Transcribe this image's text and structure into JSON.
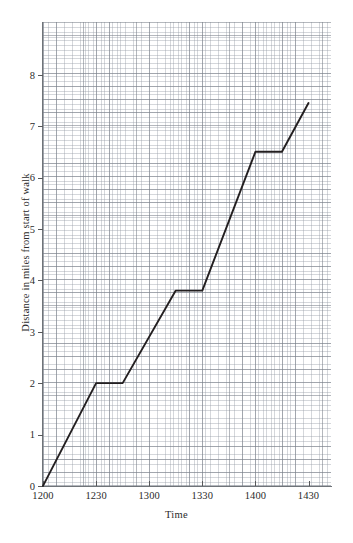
{
  "chart_data": {
    "type": "line",
    "title": "",
    "xlabel": "Time",
    "ylabel": "Distance in miles from start of walk",
    "xlim": [
      1200,
      1435
    ],
    "ylim": [
      0,
      8.75
    ],
    "grid": true,
    "grid_style": "graph paper, minor squares with darker major lines every 5 squares",
    "legend": "none",
    "x_tick_labels": [
      "1200",
      "1230",
      "1300",
      "1330",
      "1400",
      "1430"
    ],
    "x_tick_values": [
      1200,
      1230,
      1300,
      1330,
      1400,
      1430
    ],
    "y_tick_labels": [
      "0",
      "1",
      "2",
      "3",
      "4",
      "5",
      "6",
      "7",
      "8"
    ],
    "y_tick_values": [
      0,
      1,
      2,
      3,
      4,
      5,
      6,
      7,
      8
    ],
    "series": [
      {
        "name": "Distance walked",
        "color": "#231f20",
        "x": [
          1200,
          1230,
          1245,
          1315,
          1330,
          1400,
          1415,
          1430
        ],
        "y": [
          0,
          2,
          2,
          3.8,
          3.8,
          6.5,
          6.5,
          7.45
        ],
        "x_labels": [
          "1200",
          "1230",
          "1245",
          "1315",
          "1330",
          "1400",
          "1415",
          "1430"
        ]
      }
    ],
    "segments": [
      {
        "from_time": "1200",
        "to_time": "1230",
        "from_distance": 0,
        "to_distance": 2,
        "type": "walking"
      },
      {
        "from_time": "1230",
        "to_time": "1245",
        "from_distance": 2,
        "to_distance": 2,
        "type": "rest"
      },
      {
        "from_time": "1245",
        "to_time": "1315",
        "from_distance": 2,
        "to_distance": 3.8,
        "type": "walking"
      },
      {
        "from_time": "1315",
        "to_time": "1330",
        "from_distance": 3.8,
        "to_distance": 3.8,
        "type": "rest"
      },
      {
        "from_time": "1330",
        "to_time": "1400",
        "from_distance": 3.8,
        "to_distance": 6.5,
        "type": "walking"
      },
      {
        "from_time": "1400",
        "to_time": "1415",
        "from_distance": 6.5,
        "to_distance": 6.5,
        "type": "rest"
      },
      {
        "from_time": "1415",
        "to_time": "1430",
        "from_distance": 6.5,
        "to_distance": 7.45,
        "type": "walking"
      }
    ]
  },
  "axes": {
    "x_ticks": [
      {
        "label": "1200",
        "value": 1200
      },
      {
        "label": "1230",
        "value": 1230
      },
      {
        "label": "1300",
        "value": 1300
      },
      {
        "label": "1330",
        "value": 1330
      },
      {
        "label": "1400",
        "value": 1400
      },
      {
        "label": "1430",
        "value": 1430
      }
    ],
    "y_ticks": [
      {
        "label": "8",
        "value": 8
      },
      {
        "label": "7",
        "value": 7
      },
      {
        "label": "6",
        "value": 6
      },
      {
        "label": "5",
        "value": 5
      },
      {
        "label": "4",
        "value": 4
      },
      {
        "label": "3",
        "value": 3
      },
      {
        "label": "2",
        "value": 2
      },
      {
        "label": "1",
        "value": 1
      },
      {
        "label": "0",
        "value": 0
      }
    ],
    "x_title": "Time",
    "y_title": "Distance in miles from start of walk"
  },
  "colors": {
    "line": "#231f20",
    "axis": "#6f7479",
    "grid_major": "#787e88",
    "grid_minor": "#969ca6",
    "text": "#2b2b2b",
    "background": "#ffffff"
  }
}
